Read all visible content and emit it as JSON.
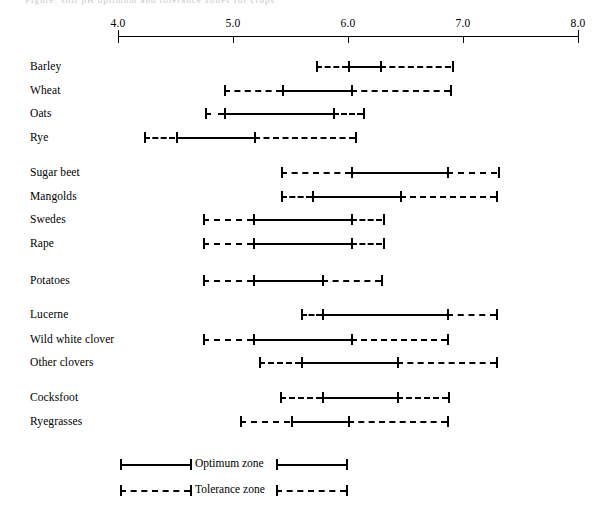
{
  "figure": {
    "cutoff_caption": "Figure: soil pH optimum and tolerance zones for crops"
  },
  "axis": {
    "ticks": [
      "4.0",
      "5.0",
      "6.0",
      "7.0",
      "8.0"
    ],
    "min": 4.0,
    "max": 8.0
  },
  "legend": {
    "optimum_label": "Optimum zone",
    "tolerance_label": "Tolerance zone"
  },
  "chart_data": {
    "type": "bar",
    "title": "",
    "xlabel": "",
    "ylabel": "",
    "xlim": [
      4.0,
      8.0
    ],
    "grid": false,
    "legend_position": "bottom",
    "annotations": [
      "Optimum zone",
      "Tolerance zone"
    ],
    "categories": [
      "Barley",
      "Wheat",
      "Oats",
      "Rye",
      "Sugar beet",
      "Mangolds",
      "Swedes",
      "Rape",
      "Potatoes",
      "Lucerne",
      "Wild white clover",
      "Other clovers",
      "Cocksfoot",
      "Ryegrasses"
    ],
    "series": [
      {
        "name": "Tolerance zone",
        "style": "dashed",
        "ranges": [
          [
            5.72,
            6.9
          ],
          [
            4.92,
            6.89
          ],
          [
            4.76,
            6.13
          ],
          [
            4.23,
            6.06
          ],
          [
            5.42,
            7.3
          ],
          [
            5.42,
            7.29
          ],
          [
            4.74,
            6.3
          ],
          [
            4.74,
            6.3
          ],
          [
            4.74,
            6.29
          ],
          [
            5.59,
            7.29
          ],
          [
            4.74,
            6.86
          ],
          [
            5.23,
            7.29
          ],
          [
            5.41,
            6.87
          ],
          [
            5.06,
            6.86
          ]
        ]
      },
      {
        "name": "Optimum zone",
        "style": "solid",
        "ranges": [
          [
            6.0,
            6.28
          ],
          [
            5.43,
            6.03
          ],
          [
            4.92,
            5.87
          ],
          [
            4.5,
            5.18
          ],
          [
            6.03,
            6.86
          ],
          [
            5.69,
            6.45
          ],
          [
            5.17,
            6.03
          ],
          [
            5.17,
            6.03
          ],
          [
            5.17,
            5.77
          ],
          [
            5.77,
            6.86
          ],
          [
            5.17,
            6.03
          ],
          [
            5.59,
            6.43
          ],
          [
            5.77,
            6.43
          ],
          [
            5.5,
            6.0
          ]
        ]
      }
    ]
  },
  "rows": [
    {
      "label": "Barley",
      "y": 60,
      "tol": [
        5.72,
        6.9
      ],
      "opt": [
        6.0,
        6.28
      ]
    },
    {
      "label": "Wheat",
      "y": 84,
      "tol": [
        4.92,
        6.89
      ],
      "opt": [
        5.43,
        6.03
      ]
    },
    {
      "label": "Oats",
      "y": 107,
      "tol": [
        4.76,
        6.13
      ],
      "opt": [
        4.92,
        5.87
      ]
    },
    {
      "label": "Rye",
      "y": 131,
      "tol": [
        4.23,
        6.06
      ],
      "opt": [
        4.5,
        5.18
      ]
    },
    {
      "label": "Sugar beet",
      "y": 166,
      "tol": [
        5.42,
        7.3
      ],
      "opt": [
        6.03,
        6.86
      ]
    },
    {
      "label": "Mangolds",
      "y": 190,
      "tol": [
        5.42,
        7.29
      ],
      "opt": [
        5.69,
        6.45
      ]
    },
    {
      "label": "Swedes",
      "y": 213,
      "tol": [
        4.74,
        6.3
      ],
      "opt": [
        5.17,
        6.03
      ]
    },
    {
      "label": "Rape",
      "y": 237,
      "tol": [
        4.74,
        6.3
      ],
      "opt": [
        5.17,
        6.03
      ]
    },
    {
      "label": "Potatoes",
      "y": 274,
      "tol": [
        4.74,
        6.29
      ],
      "opt": [
        5.17,
        5.77
      ]
    },
    {
      "label": "Lucerne",
      "y": 308,
      "tol": [
        5.59,
        7.29
      ],
      "opt": [
        5.77,
        6.86
      ]
    },
    {
      "label": "Wild white clover",
      "y": 333,
      "tol": [
        4.74,
        6.86
      ],
      "opt": [
        5.17,
        6.03
      ]
    },
    {
      "label": "Other clovers",
      "y": 356,
      "tol": [
        5.23,
        7.29
      ],
      "opt": [
        5.59,
        6.43
      ]
    },
    {
      "label": "Cocksfoot",
      "y": 391,
      "tol": [
        5.41,
        6.87
      ],
      "opt": [
        5.77,
        6.43
      ]
    },
    {
      "label": "Ryegrasses",
      "y": 415,
      "tol": [
        5.06,
        6.86
      ],
      "opt": [
        5.5,
        6.0
      ]
    }
  ],
  "geometry": {
    "x_at_min": 118,
    "px_per_unit": 115,
    "label_x": 30,
    "axis_y": 36,
    "tick_len": 7
  }
}
